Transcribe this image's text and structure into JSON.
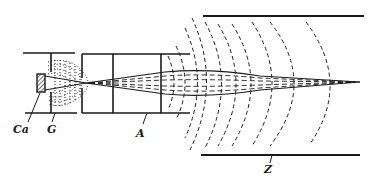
{
  "diagram": {
    "type": "electron-beam focusing schematic",
    "colors": {
      "ink": "#1a1a1a",
      "background": "#ffffff"
    },
    "labels": {
      "cathode": "Ca",
      "grid": "G",
      "anode": "A",
      "screen_plate": "Z"
    }
  }
}
